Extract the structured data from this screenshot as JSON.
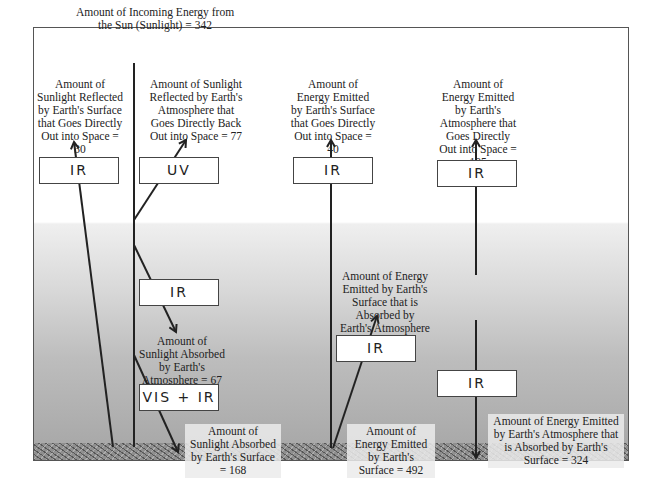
{
  "diagram": {
    "incoming": {
      "text": "Amount of Incoming Energy from the Sun (Sunlight) = 342",
      "value": 342
    },
    "labels": {
      "surface_reflected": "Amount of Sunlight Reflected by Earth's Surface that Goes Directly Out into Space = 30",
      "atmosphere_reflected": "Amount of Sunlight Reflected by Earth's Atmosphere that Goes Directly Back Out into Space = 77",
      "surface_emitted_space": "Amount of Energy Emitted by Earth's Surface that Goes Directly Out into Space = 40",
      "atmosphere_emitted_space": "Amount of Energy Emitted by Earth's Atmosphere that Goes Directly Out into Space = 195",
      "surface_emitted_absorbed_atm": "Amount of Energy Emitted by Earth's Surface that is Absorbed by Earth's Atmosphere = 452",
      "sunlight_absorbed_atm": "Amount of Sunlight Absorbed by Earth's Atmosphere = 67",
      "sunlight_absorbed_surface": "Amount of Sunlight Absorbed by Earth's Surface = 168",
      "surface_emitted_total": "Amount of Energy Emitted by Earth's Surface = 492",
      "atm_emitted_absorbed_surface": "Amount of Energy Emitted by Earth's Atmosphere that is Absorbed by Earth's Surface = 324"
    },
    "boxes": {
      "surface_reflected": "IR",
      "atmosphere_reflected": "UV",
      "surface_emitted_space": "IR",
      "atmosphere_emitted_space": "IR",
      "sunlight_absorbed_atm": "IR",
      "surface_emitted_absorbed_atm": "IR",
      "atm_emitted_surface": "IR",
      "sunlight_absorbed_surface": "VIS + IR"
    },
    "colors": {
      "line": "#222222",
      "frame": "#555555",
      "ground": "#8f8f8f"
    }
  }
}
